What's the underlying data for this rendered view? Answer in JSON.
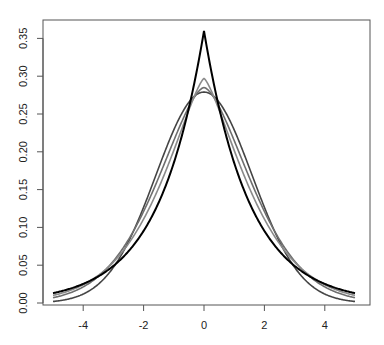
{
  "chart_data": {
    "type": "line",
    "title": "",
    "xlabel": "",
    "ylabel": "",
    "xlim": [
      -5,
      5
    ],
    "ylim": [
      0,
      0.36
    ],
    "grid": false,
    "legend": null,
    "x_ticks": [
      "-4",
      "-2",
      "0",
      "2",
      "4"
    ],
    "y_ticks": [
      "0.00",
      "0.05",
      "0.10",
      "0.15",
      "0.20",
      "0.25",
      "0.30",
      "0.35"
    ],
    "series": [
      {
        "name": "curve 1 (black, sharpest peak, heaviest tails)",
        "color": "#000000",
        "peak": 0.36,
        "value_at_x5": 0.013
      },
      {
        "name": "curve 2 (gray)",
        "color": "#8a8a8a",
        "peak": 0.297,
        "value_at_x5": 0.01
      },
      {
        "name": "curve 3 (gray)",
        "color": "#6e6e6e",
        "peak": 0.285,
        "value_at_x5": 0.007
      },
      {
        "name": "curve 4 (dark gray, widest peak, lightest tails)",
        "color": "#444444",
        "peak": 0.279,
        "value_at_x5": 0.002
      }
    ]
  }
}
